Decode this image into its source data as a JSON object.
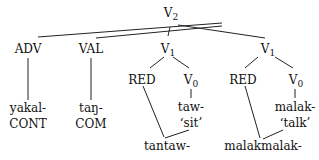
{
  "tree": {
    "root": {
      "label": "V",
      "sub": "2"
    },
    "nodes": {
      "adv": {
        "label": "ADV"
      },
      "val": {
        "label": "VAL"
      },
      "v1_left": {
        "label": "V",
        "sub": "1"
      },
      "v1_right": {
        "label": "V",
        "sub": "1"
      },
      "red_left": {
        "label": "RED"
      },
      "v0_left": {
        "label": "V",
        "sub": "0"
      },
      "red_right": {
        "label": "RED"
      },
      "v0_right": {
        "label": "V",
        "sub": "0"
      }
    },
    "leaves": {
      "adv_form": "yakal-",
      "adv_gloss": "CONT",
      "val_form": "taŋ-",
      "val_gloss": "COM",
      "v0_left_form": "taw-",
      "v0_left_gloss": "‘sit’",
      "v0_right_form": "malak-",
      "v0_right_gloss": "‘talk’",
      "left_result": "tantaw-",
      "right_result": "malakmalak-"
    }
  }
}
